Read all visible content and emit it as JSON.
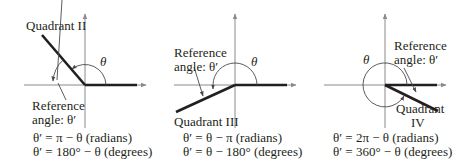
{
  "panels": [
    {
      "quadrant_label": "Quadrant II",
      "theta_label": "θ",
      "reference_label_line1": "Reference",
      "reference_label_line2": "angle:  θ′",
      "formula_radians": "θ′ = π − θ (radians)",
      "formula_degrees": "θ′ = 180° − θ (degrees)"
    },
    {
      "quadrant_label": "Quadrant III",
      "theta_label": "θ",
      "reference_label_line1": "Reference",
      "reference_label_line2": "angle:  θ′",
      "formula_radians": "θ′ = θ − π (radians)",
      "formula_degrees": "θ′ = θ − 180° (degrees)"
    },
    {
      "quadrant_label_line1": "Quadrant",
      "quadrant_label_line2": "IV",
      "theta_label": "θ",
      "reference_label_line1": "Reference",
      "reference_label_line2": "angle:  θ′",
      "formula_radians": "θ′ = 2π − θ (radians)",
      "formula_degrees": "θ′ = 360° − θ (degrees)"
    }
  ]
}
